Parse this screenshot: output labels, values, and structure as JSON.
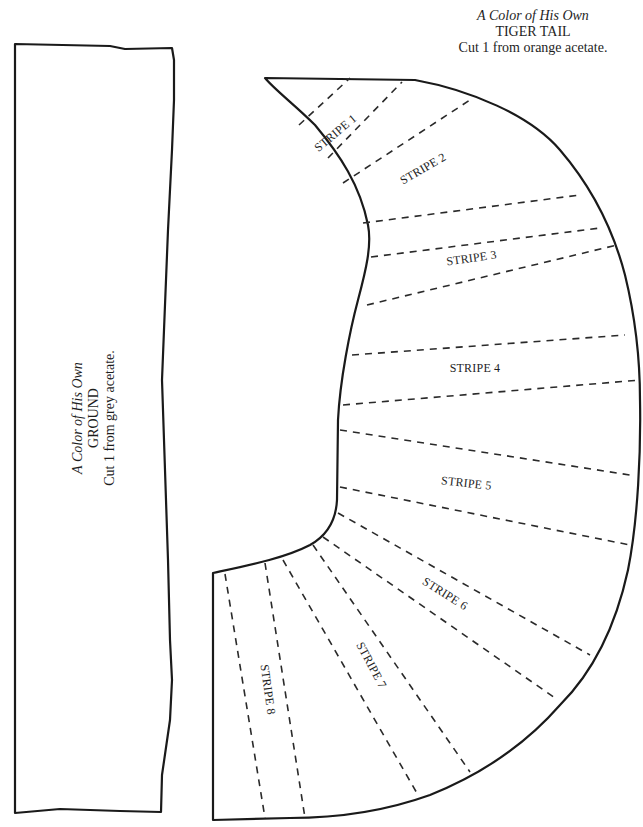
{
  "tail_piece": {
    "caption": {
      "title": "A Color of His Own",
      "name": "TIGER TAIL",
      "instruction": "Cut 1 from orange acetate."
    },
    "stripes": [
      {
        "label": "STRIPE 1"
      },
      {
        "label": "STRIPE 2"
      },
      {
        "label": "STRIPE 3"
      },
      {
        "label": "STRIPE 4"
      },
      {
        "label": "STRIPE 5"
      },
      {
        "label": "STRIPE 6"
      },
      {
        "label": "STRIPE 7"
      },
      {
        "label": "STRIPE 8"
      }
    ]
  },
  "ground_piece": {
    "caption": {
      "title": "A Color of His Own",
      "name": "GROUND",
      "instruction": "Cut 1 from grey acetate."
    }
  },
  "colors": {
    "outline": "#1a1a1a",
    "background": "#ffffff"
  }
}
